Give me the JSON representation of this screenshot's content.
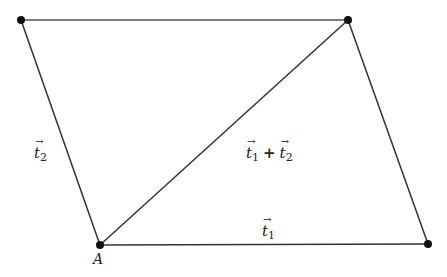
{
  "diagram": {
    "type": "parallelogram vector addition",
    "points": [
      {
        "id": "A",
        "label": "A",
        "x": 100,
        "y": 245
      },
      {
        "id": "B",
        "label": "",
        "x": 428,
        "y": 244
      },
      {
        "id": "C",
        "label": "",
        "x": 348,
        "y": 20
      },
      {
        "id": "D",
        "label": "",
        "x": 21,
        "y": 20
      }
    ],
    "edges": [
      {
        "from": "A",
        "to": "B"
      },
      {
        "from": "B",
        "to": "C"
      },
      {
        "from": "C",
        "to": "D"
      },
      {
        "from": "D",
        "to": "A"
      },
      {
        "from": "A",
        "to": "C"
      }
    ],
    "labels": {
      "point_a": "A",
      "t1_base": "t",
      "t1_sub": "1",
      "t2_base": "t",
      "t2_sub": "2",
      "sum_t1_base": "t",
      "sum_t1_sub": "1",
      "sum_plus": "+",
      "sum_t2_base": "t",
      "sum_t2_sub": "2"
    },
    "colors": {
      "line": "#333333",
      "point": "#111111"
    }
  }
}
